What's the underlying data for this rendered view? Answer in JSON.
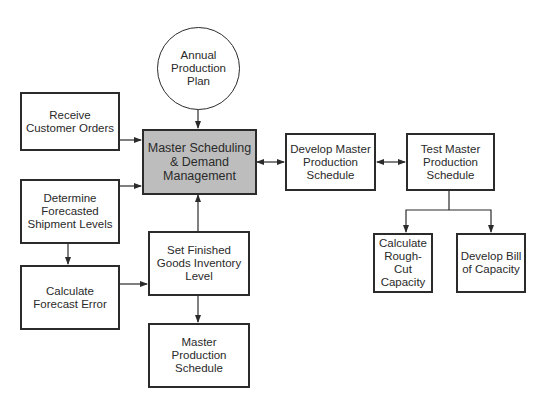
{
  "diagram": {
    "nodes": {
      "annual_plan": "Annual\nProduction\nPlan",
      "receive_orders": "Receive\nCustomer Orders",
      "master_scheduling": "Master Scheduling\n& Demand\nManagement",
      "determine_forecast": "Determine\nForecasted\nShipment Levels",
      "calc_forecast_error": "Calculate\nForecast Error",
      "set_inventory": "Set Finished\nGoods Inventory\nLevel",
      "mps_output": "Master\nProduction\nSchedule",
      "develop_mps": "Develop Master\nProduction\nSchedule",
      "test_mps": "Test Master\nProduction\nSchedule",
      "rough_cut": "Calculate\nRough-Cut\nCapacity",
      "bill_capacity": "Develop Bill\nof Capacity"
    },
    "edges": [
      {
        "from": "annual_plan",
        "to": "master_scheduling",
        "direction": "one-way"
      },
      {
        "from": "receive_orders",
        "to": "master_scheduling",
        "direction": "one-way"
      },
      {
        "from": "determine_forecast",
        "to": "master_scheduling",
        "direction": "one-way"
      },
      {
        "from": "determine_forecast",
        "to": "calc_forecast_error",
        "direction": "one-way"
      },
      {
        "from": "calc_forecast_error",
        "to": "set_inventory",
        "direction": "one-way"
      },
      {
        "from": "set_inventory",
        "to": "master_scheduling",
        "direction": "one-way"
      },
      {
        "from": "set_inventory",
        "to": "mps_output",
        "direction": "one-way"
      },
      {
        "from": "master_scheduling",
        "to": "develop_mps",
        "direction": "two-way"
      },
      {
        "from": "develop_mps",
        "to": "test_mps",
        "direction": "two-way"
      },
      {
        "from": "test_mps",
        "to": "rough_cut",
        "direction": "one-way"
      },
      {
        "from": "test_mps",
        "to": "bill_capacity",
        "direction": "one-way"
      }
    ],
    "colors": {
      "main_fill": "#bdbdbd",
      "line": "#2b2b2b"
    }
  }
}
